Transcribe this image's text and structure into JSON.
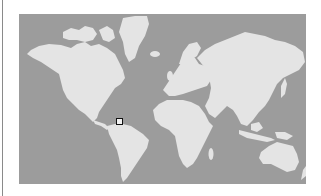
{
  "map": {
    "projection": "mercator",
    "colors": {
      "ocean": "#9c9c9c",
      "land": "#e4e4e4",
      "marker_border": "#111111",
      "marker_fill": "#f2f2f2",
      "left_rule": "#8a8a8a"
    },
    "continents": [
      {
        "name": "North America"
      },
      {
        "name": "Greenland"
      },
      {
        "name": "South America"
      },
      {
        "name": "Europe"
      },
      {
        "name": "Africa"
      },
      {
        "name": "Asia"
      },
      {
        "name": "Australia"
      }
    ],
    "marker": {
      "icon": "square-location-marker",
      "x": 116,
      "y": 118,
      "region": "northern South America"
    }
  }
}
